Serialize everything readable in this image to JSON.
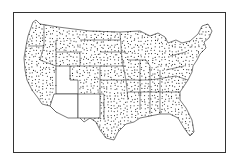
{
  "map": {
    "subject": "Contiguous United States",
    "style": "dot-distribution map, black and white",
    "frame": {
      "stroke": "#333333",
      "background": "#ffffff"
    },
    "dot_color": "#222222",
    "blank_states": [
      "Utah",
      "Arizona",
      "New Mexico"
    ],
    "dotted_states": "all other contiguous states"
  }
}
